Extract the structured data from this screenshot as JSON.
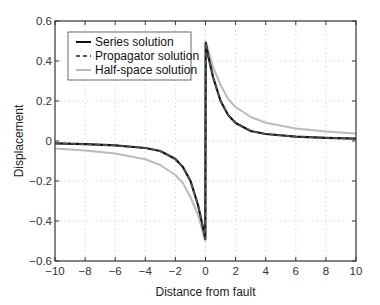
{
  "chart_data": {
    "type": "line",
    "title": "",
    "xlabel": "Distance from fault",
    "ylabel": "Displacement",
    "xlim": [
      -10,
      10
    ],
    "ylim": [
      -0.6,
      0.6
    ],
    "xticks": [
      -10,
      -8,
      -6,
      -4,
      -2,
      0,
      2,
      4,
      6,
      8,
      10
    ],
    "yticks": [
      -0.6,
      -0.4,
      -0.2,
      0,
      0.2,
      0.4,
      0.6
    ],
    "xtick_labels": [
      "−10",
      "−8",
      "−6",
      "−4",
      "−2",
      "0",
      "2",
      "4",
      "6",
      "8",
      "10"
    ],
    "ytick_labels": [
      "−0.6",
      "−0.4",
      "−0.2",
      "0",
      "0.2",
      "0.4",
      "0.6"
    ],
    "grid": true,
    "legend_position": "upper left",
    "x": [
      -10,
      -8,
      -6,
      -4,
      -3,
      -2,
      -1.5,
      -1,
      -0.5,
      -0.2,
      -0.01,
      0.01,
      0.2,
      0.5,
      1,
      1.5,
      2,
      3,
      4,
      6,
      8,
      10
    ],
    "series": [
      {
        "name": "Series solution",
        "style": "solid",
        "color": "#111111",
        "values": [
          -0.012,
          -0.016,
          -0.022,
          -0.035,
          -0.05,
          -0.09,
          -0.13,
          -0.2,
          -0.32,
          -0.42,
          -0.49,
          0.49,
          0.42,
          0.32,
          0.2,
          0.13,
          0.09,
          0.05,
          0.035,
          0.022,
          0.016,
          0.012
        ]
      },
      {
        "name": "Propagator solution",
        "style": "dashed",
        "color": "#555555",
        "values": [
          -0.012,
          -0.016,
          -0.022,
          -0.035,
          -0.05,
          -0.09,
          -0.13,
          -0.2,
          -0.32,
          -0.42,
          -0.49,
          0.49,
          0.42,
          0.32,
          0.2,
          0.13,
          0.09,
          0.05,
          0.035,
          0.022,
          0.016,
          0.012
        ]
      },
      {
        "name": "Half-space solution",
        "style": "solid",
        "color": "#bbbbbb",
        "values": [
          -0.038,
          -0.047,
          -0.062,
          -0.091,
          -0.12,
          -0.17,
          -0.21,
          -0.28,
          -0.37,
          -0.45,
          -0.5,
          0.5,
          0.45,
          0.37,
          0.28,
          0.21,
          0.17,
          0.12,
          0.091,
          0.062,
          0.047,
          0.038
        ]
      }
    ]
  }
}
